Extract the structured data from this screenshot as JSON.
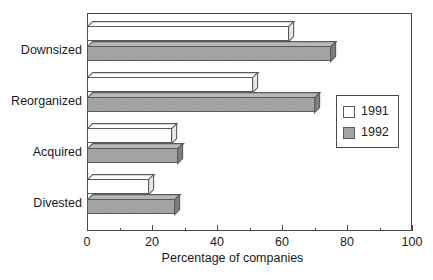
{
  "chart_data": {
    "type": "bar",
    "orientation": "horizontal",
    "title": "",
    "xlabel": "Percentage of companies",
    "ylabel": "",
    "xlim": [
      0,
      100
    ],
    "xticks": [
      0,
      20,
      40,
      60,
      80,
      100
    ],
    "xtick_labels": [
      "0",
      "20",
      "40",
      "60",
      "80",
      "100"
    ],
    "minor_tick_step": 10,
    "grid": false,
    "categories": [
      "Downsized",
      "Reorganized",
      "Acquired",
      "Divested"
    ],
    "series": [
      {
        "name": "1991",
        "color": "#ffffff",
        "values": [
          62,
          51,
          26,
          19
        ]
      },
      {
        "name": "1992",
        "color": "#9a9a9a",
        "values": [
          75,
          70,
          28,
          27
        ]
      }
    ],
    "legend": {
      "position": "center-right",
      "entries": [
        {
          "label": "1991",
          "swatch": "white-square"
        },
        {
          "label": "1992",
          "swatch": "gray-square"
        }
      ]
    },
    "style": {
      "frame_color": "#4a4a4a",
      "bar_edge_color": "#5a5a5a",
      "background": "#ffffff",
      "three_d": true
    }
  }
}
